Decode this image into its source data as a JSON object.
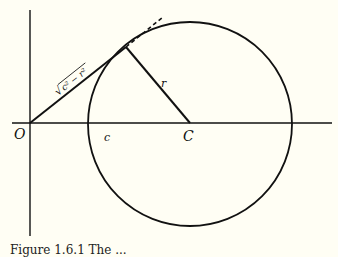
{
  "diagram": {
    "labels": {
      "origin": "O",
      "center": "C",
      "distance": "c",
      "radius": "r",
      "tangent_length": "√(c² − r²)"
    },
    "tangent_label": {
      "radical": "√",
      "expr": "c² − r²"
    },
    "geometry": {
      "origin": [
        30,
        123
      ],
      "center": [
        190,
        123
      ],
      "circle_radius": 102,
      "tangent_point": [
        126,
        47
      ],
      "tangent_dashed_end": [
        163,
        16
      ]
    },
    "colors": {
      "stroke": "#111111",
      "background": "#fffef4"
    }
  },
  "caption": {
    "text": "Figure 1.6.1   The ..."
  }
}
